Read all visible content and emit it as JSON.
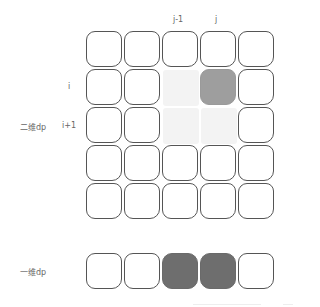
{
  "diagram": {
    "col_labels": {
      "j_minus_1": "j-1",
      "j": "j"
    },
    "row_labels": {
      "i": "i",
      "i_plus_1": "i+1"
    },
    "labels": {
      "dp2d": "二维dp",
      "dp1d": "一维dp"
    },
    "grid_2d": {
      "rows": 5,
      "cols": 5,
      "highlights": [
        {
          "row": 1,
          "col": 2,
          "shade": "light",
          "color": "#f3f3f3"
        },
        {
          "row": 1,
          "col": 3,
          "shade": "mid",
          "color": "#9e9e9e"
        },
        {
          "row": 2,
          "col": 2,
          "shade": "light",
          "color": "#f3f3f3"
        },
        {
          "row": 2,
          "col": 3,
          "shade": "light",
          "color": "#f3f3f3"
        }
      ]
    },
    "grid_1d": {
      "cols": 5,
      "highlights": [
        {
          "col": 2,
          "shade": "dark",
          "color": "#6e6e6e"
        },
        {
          "col": 3,
          "shade": "dark",
          "color": "#6e6e6e"
        }
      ]
    }
  }
}
